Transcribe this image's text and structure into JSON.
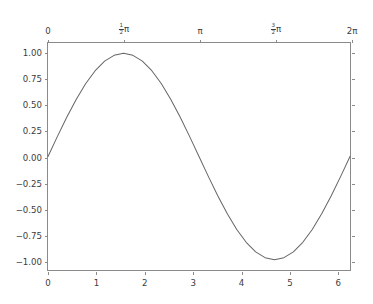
{
  "figure": {
    "background_color": "#ffffff",
    "axes_background_color": "#ffffff",
    "frame_color": "#8a8a8a",
    "line_color": "#656565",
    "tick_label_color": "#3c3c3c"
  },
  "chart_data": {
    "type": "line",
    "title": "",
    "xlabel": "",
    "ylabel": "",
    "xlim": [
      0,
      6.283185307179586
    ],
    "ylim": [
      -1.1,
      1.1
    ],
    "grid": false,
    "legend": null,
    "series": [
      {
        "name": "sin(x)",
        "color": "#656565",
        "linewidth": 1.0,
        "x": [
          0.0,
          0.19634954,
          0.39269908,
          0.58904862,
          0.78539816,
          0.9817477,
          1.17809725,
          1.37444679,
          1.57079633,
          1.76714587,
          1.96349541,
          2.15984495,
          2.35619449,
          2.55254403,
          2.74889357,
          2.94524311,
          3.14159265,
          3.33794219,
          3.53429174,
          3.73064128,
          3.92699082,
          4.12334036,
          4.3196899,
          4.51603944,
          4.71238898,
          4.90873852,
          5.10508806,
          5.3014376,
          5.49778714,
          5.69413668,
          5.89048623,
          6.08683577,
          6.28318531
        ],
        "y": [
          0.0,
          0.19509032,
          0.38268343,
          0.55557023,
          0.70710678,
          0.83146961,
          0.92387953,
          0.98078528,
          1.0,
          0.98078528,
          0.92387953,
          0.83146961,
          0.70710678,
          0.55557023,
          0.38268343,
          0.19509032,
          0.0,
          -0.19509032,
          -0.38268343,
          -0.55557023,
          -0.70710678,
          -0.83146961,
          -0.92387953,
          -0.98078528,
          -1.0,
          -0.98078528,
          -0.92387953,
          -0.83146961,
          -0.70710678,
          -0.55557023,
          -0.38268343,
          -0.19509032,
          0.0
        ]
      }
    ],
    "x_axis_bottom": {
      "label": "",
      "ticks": [
        0,
        1,
        2,
        3,
        4,
        5,
        6
      ],
      "ticklabels": [
        "0",
        "1",
        "2",
        "3",
        "4",
        "5",
        "6"
      ]
    },
    "x_axis_top": {
      "label": "",
      "ticks": [
        0,
        1.5707963,
        3.1415927,
        4.712389,
        6.2831853
      ],
      "ticklabels": [
        "0",
        "1/2 pi",
        "pi",
        "3/2 pi",
        "2 pi"
      ],
      "ticklabel_parts": [
        {
          "numerator": "",
          "denominator": "",
          "symbol": "0"
        },
        {
          "numerator": "1",
          "denominator": "2",
          "symbol": "π"
        },
        {
          "numerator": "",
          "denominator": "",
          "symbol": "π"
        },
        {
          "numerator": "3",
          "denominator": "2",
          "symbol": "π"
        },
        {
          "numerator": "",
          "denominator": "",
          "symbol": "2π"
        }
      ]
    },
    "y_axis": {
      "label": "",
      "ticks": [
        1.0,
        0.75,
        0.5,
        0.25,
        0.0,
        -0.25,
        -0.5,
        -0.75,
        -1.0
      ],
      "ticklabels": [
        "1.00",
        "0.75",
        "0.50",
        "0.25",
        "0.00",
        "−0.25",
        "−0.50",
        "−0.75",
        "−1.00"
      ]
    }
  }
}
